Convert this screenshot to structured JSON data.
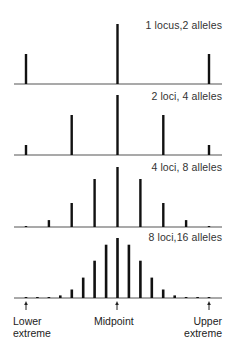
{
  "figure": {
    "colors": {
      "bar": "#111111",
      "baseline": "#555555",
      "text": "#333333"
    },
    "x_positions": {
      "lower_extreme": 26,
      "midpoint": 117,
      "upper_extreme": 209
    },
    "panels": [
      {
        "label": "1 locus,2 alleles",
        "baseline_y": 84,
        "label_y": 19,
        "frequencies": [
          1,
          2,
          1
        ]
      },
      {
        "label": "2 loci, 4 alleles",
        "baseline_y": 155,
        "label_y": 90,
        "frequencies": [
          1,
          4,
          6,
          4,
          1
        ]
      },
      {
        "label": "4 loci, 8 alleles",
        "baseline_y": 227,
        "label_y": 161,
        "frequencies": [
          1,
          8,
          28,
          56,
          70,
          56,
          28,
          8,
          1
        ]
      },
      {
        "label": "8 loci,16 alleles",
        "baseline_y": 298,
        "label_y": 231,
        "frequencies": [
          1,
          16,
          120,
          560,
          1820,
          4368,
          8008,
          11440,
          12870,
          11440,
          8008,
          4368,
          1820,
          560,
          120,
          16,
          1
        ]
      }
    ],
    "axis_labels": {
      "lower": [
        "Lower",
        "extreme"
      ],
      "mid": "Midpoint",
      "upper": [
        "Upper",
        "extreme"
      ]
    }
  },
  "chart_data": {
    "type": "bar",
    "title": "",
    "xlabel": "Phenotype (number of contributing alleles)",
    "ylabel": "Frequency",
    "series": [
      {
        "name": "1 locus,2 alleles",
        "categories": [
          "Lower extreme",
          "Midpoint",
          "Upper extreme"
        ],
        "values": [
          1,
          2,
          1
        ]
      },
      {
        "name": "2 loci, 4 alleles",
        "values": [
          1,
          4,
          6,
          4,
          1
        ]
      },
      {
        "name": "4 loci, 8 alleles",
        "values": [
          1,
          8,
          28,
          56,
          70,
          56,
          28,
          8,
          1
        ]
      },
      {
        "name": "8 loci,16 alleles",
        "values": [
          1,
          16,
          120,
          560,
          1820,
          4368,
          8008,
          11440,
          12870,
          11440,
          8008,
          4368,
          1820,
          560,
          120,
          16,
          1
        ]
      }
    ],
    "x_annotations": [
      "Lower extreme",
      "Midpoint",
      "Upper extreme"
    ],
    "grid": false
  }
}
